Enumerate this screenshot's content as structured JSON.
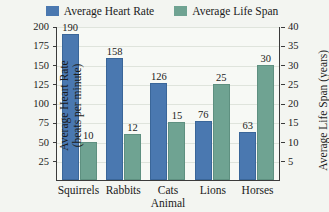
{
  "chart_data": {
    "type": "bar",
    "title": "",
    "subtitle": "",
    "categories": [
      "Squirrels",
      "Rabbits",
      "Cats",
      "Lions",
      "Horses"
    ],
    "series": [
      {
        "name": "Average Heart Rate",
        "values": [
          190,
          158,
          126,
          76,
          63
        ],
        "axis": "left",
        "color": "#4a78b0"
      },
      {
        "name": "Average Life Span",
        "values": [
          10,
          12,
          15,
          25,
          30
        ],
        "axis": "right",
        "color": "#6fa392"
      }
    ],
    "xlabel": "Animal",
    "ylabel": "Average Heart Rate (beats per minute)",
    "y2label": "Average Life Span (years)",
    "ylim": [
      0,
      200
    ],
    "y2lim": [
      0,
      40
    ],
    "yticks": [
      25,
      50,
      75,
      100,
      125,
      150,
      175,
      200
    ],
    "y2ticks": [
      5,
      10,
      15,
      20,
      25,
      30,
      35,
      40
    ],
    "grid": true,
    "legend_position": "top-center"
  },
  "legend": {
    "entries": [
      {
        "label": "Average Heart Rate",
        "color": "#4a78b0"
      },
      {
        "label": "Average Life Span",
        "color": "#6fa392"
      }
    ]
  },
  "axes": {
    "left": {
      "title_line1": "Average Heart Rate",
      "title_line2": "(beats per minute)",
      "ticks": [
        "200",
        "175",
        "150",
        "125",
        "100",
        "75",
        "50",
        "25"
      ]
    },
    "right": {
      "title": "Average Life Span (years)",
      "ticks": [
        "40",
        "35",
        "30",
        "25",
        "20",
        "15",
        "10",
        "5"
      ]
    },
    "bottom": {
      "title": "Animal",
      "ticks": [
        "Squirrels",
        "Rabbits",
        "Cats",
        "Lions",
        "Horses"
      ]
    }
  },
  "bar_labels": {
    "heart": [
      "190",
      "158",
      "126",
      "76",
      "63"
    ],
    "life": [
      "10",
      "12",
      "15",
      "25",
      "30"
    ]
  },
  "colors": {
    "heart_rate": "#4a78b0",
    "life_span": "#6fa392",
    "background": "#f3f5f1",
    "plot_background": "#f7f9f5",
    "axis": "#3b3b3b",
    "gridline": "#dfe4dc"
  }
}
